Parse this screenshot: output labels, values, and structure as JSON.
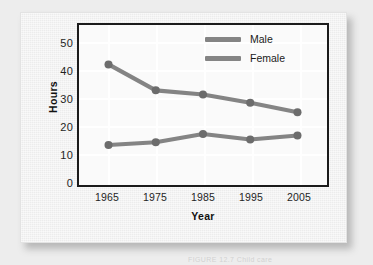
{
  "figure": {
    "caption": "FIGURE 12.7   Child care"
  },
  "chart_data": {
    "type": "line",
    "title": "",
    "xlabel": "Year",
    "ylabel": "Hours",
    "categories": [
      "1965",
      "1975",
      "1985",
      "1995",
      "2005"
    ],
    "x": [
      1965,
      1975,
      1985,
      1995,
      2005
    ],
    "series": [
      {
        "name": "Male",
        "values": [
          42,
          32.5,
          31,
          28,
          24.5
        ],
        "color": "#848484"
      },
      {
        "name": "Female",
        "values": [
          12.5,
          13.5,
          16.5,
          14.5,
          16
        ],
        "color": "#848484"
      }
    ],
    "ylim": [
      0,
      55
    ],
    "yticks": [
      "0",
      "10",
      "20",
      "30",
      "40",
      "50"
    ],
    "ytick_values": [
      0,
      10,
      20,
      30,
      40,
      50
    ],
    "xlim": [
      1960,
      2010
    ],
    "grid": true,
    "grid_color": "#ffffff",
    "legend_position": "top-right",
    "marker": "circle",
    "marker_color": "#6c6c6c",
    "plot_background": "#fafafa",
    "frame_color": "#1b1b1b"
  },
  "legend": {
    "entries": [
      {
        "label": "Male"
      },
      {
        "label": "Female"
      }
    ]
  }
}
